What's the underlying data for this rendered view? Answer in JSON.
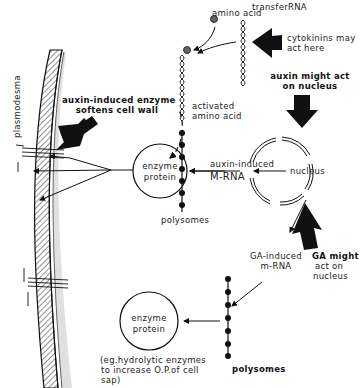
{
  "diagram": {
    "type": "hormone action in plant cell",
    "labels": {
      "amino_acid": "amino acid",
      "transfer_rna": "transferRNA",
      "cytokinins": [
        "cytokinins may",
        "act here"
      ],
      "auxin_nucleus": [
        "auxin might act",
        "on nucleus"
      ],
      "activated_amino_acid": [
        "activated",
        "amino acid"
      ],
      "auxin_enzyme": [
        "auxin-induced enzyme",
        "softens cell wall"
      ],
      "plasmodesma": "plasmodesma",
      "enzyme_protein_top": [
        "enzyme",
        "protein"
      ],
      "auxin_mrna": [
        "auxin-induced",
        "M-RNA"
      ],
      "nucleus": "nucleus",
      "polysomes_top": "polysomes",
      "ga_mrna": [
        "GA-induced",
        "m-RNA"
      ],
      "ga_nucleus": [
        "GA might",
        "act on",
        "nucleus"
      ],
      "enzyme_protein_bottom": [
        "enzyme",
        "protein"
      ],
      "hydrolytic_note": [
        "(eg.hydrolytic enzymes",
        "to increase O.P.of cell",
        "sap)"
      ],
      "polysomes_bottom": "polysomes"
    },
    "colors": {
      "ink": "#111111",
      "stipple": "#9a9a9a",
      "background": "#ffffff"
    }
  }
}
